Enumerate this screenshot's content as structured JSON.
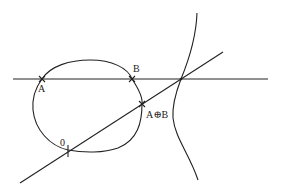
{
  "diagram": {
    "type": "elliptic-curve-group-law",
    "stroke_color": "#222222",
    "background": "#ffffff",
    "points": {
      "A": {
        "label": "A"
      },
      "B": {
        "label": "B"
      },
      "sum": {
        "label": "A⊕B"
      },
      "zero": {
        "label": "0"
      }
    }
  }
}
